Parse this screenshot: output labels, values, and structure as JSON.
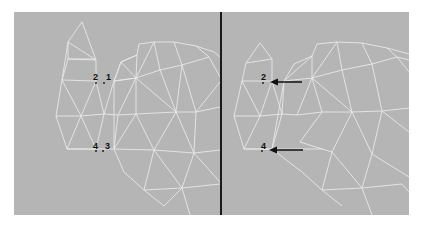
{
  "figure": {
    "left_panel": {
      "vertex_labels": [
        {
          "id": "2",
          "label": "2"
        },
        {
          "id": "1",
          "label": "1"
        },
        {
          "id": "4",
          "label": "4"
        },
        {
          "id": "3",
          "label": "3"
        }
      ]
    },
    "right_panel": {
      "vertex_labels": [
        {
          "id": "2",
          "label": "2"
        },
        {
          "id": "4",
          "label": "4"
        }
      ],
      "arrows": [
        {
          "points_to": "2"
        },
        {
          "points_to": "4"
        }
      ]
    },
    "colors": {
      "background": "#b5b5b5",
      "mesh_lines": "#e8e8e8",
      "divider": "#1a1a1a",
      "labels": "#111111"
    }
  }
}
